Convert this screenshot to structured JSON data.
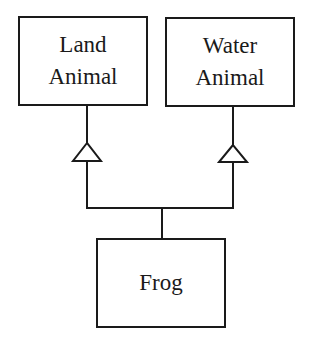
{
  "diagram": {
    "type": "uml-class-inheritance",
    "classes": [
      {
        "id": "land",
        "lines": [
          "Land",
          "Animal"
        ]
      },
      {
        "id": "water",
        "lines": [
          "Water",
          "Animal"
        ]
      },
      {
        "id": "frog",
        "lines": [
          "Frog"
        ]
      }
    ],
    "relationships": [
      {
        "from": "Frog",
        "to": "Land Animal",
        "kind": "generalization"
      },
      {
        "from": "Frog",
        "to": "Water Animal",
        "kind": "generalization"
      }
    ],
    "colors": {
      "stroke": "#1a1a1a",
      "background": "#ffffff"
    }
  }
}
